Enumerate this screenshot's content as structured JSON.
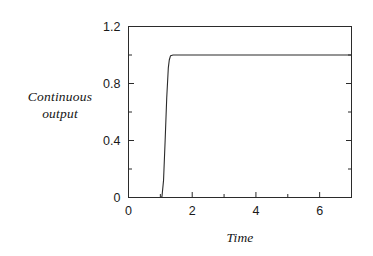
{
  "chart_data": {
    "type": "line",
    "title": "",
    "subtitle": "",
    "xlabel": "Time",
    "ylabel": "Continuous output",
    "ylabel_line1": "Continuous",
    "ylabel_line2": "output",
    "xlim": [
      0,
      7
    ],
    "ylim": [
      0,
      1.2
    ],
    "grid": false,
    "legend": null,
    "frame": "full-box",
    "tick_direction": "in",
    "line_color": "#262626",
    "line_width": 1,
    "xticks": [
      0,
      1,
      2,
      3,
      4,
      5,
      6,
      7
    ],
    "xticklabels": [
      "0",
      "",
      "2",
      "",
      "4",
      "",
      "6",
      ""
    ],
    "xtick_major_labeled": [
      "0",
      "2",
      "4",
      "6"
    ],
    "yticks": [
      0,
      0.2,
      0.4,
      0.6,
      0.8,
      1.0,
      1.2
    ],
    "yticklabels": [
      "0",
      "",
      "0.4",
      "",
      "0.8",
      "",
      "1.2"
    ],
    "ytick_major_labeled": [
      "0",
      "0.4",
      "0.8",
      "1.2"
    ],
    "series": [
      {
        "name": "Continuous output",
        "description": "Step response: holds at 0 until t=1.05, rises steeply to 1.0 by t=1.30, then remains at 1.0 through t=7",
        "x": [
          0.0,
          0.2,
          0.4,
          0.6,
          0.8,
          1.0,
          1.05,
          1.1,
          1.15,
          1.2,
          1.25,
          1.28,
          1.32,
          1.4,
          1.6,
          2.0,
          2.5,
          3.0,
          3.5,
          4.0,
          4.5,
          5.0,
          5.5,
          6.0,
          6.5,
          7.0
        ],
        "y": [
          0.0,
          0.0,
          0.0,
          0.0,
          0.0,
          0.0,
          0.005,
          0.12,
          0.4,
          0.7,
          0.91,
          0.965,
          0.995,
          1.0,
          1.0,
          1.0,
          1.0,
          1.0,
          1.0,
          1.0,
          1.0,
          1.0,
          1.0,
          1.0,
          1.0,
          1.0
        ]
      }
    ],
    "annotations": []
  },
  "axes": {
    "x_title": "Time",
    "y_title_line1": "Continuous",
    "y_title_line2": "output"
  }
}
